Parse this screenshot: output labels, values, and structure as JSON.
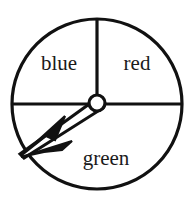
{
  "figure": {
    "name": "spinner-wheel",
    "background_color": "#ffffff",
    "stroke_color": "#111111",
    "text_color": "#1a1a1a"
  },
  "wheel": {
    "center_x": 97,
    "center_y": 104,
    "radius": 85,
    "outline_width": 3
  },
  "sectors": [
    {
      "id": "blue",
      "label": "blue",
      "start_angle_deg": 90,
      "end_angle_deg": 180,
      "span_deg": 90,
      "fraction": 0.25,
      "label_x": 59,
      "label_y": 70
    },
    {
      "id": "red",
      "label": "red",
      "start_angle_deg": 0,
      "end_angle_deg": 90,
      "span_deg": 90,
      "fraction": 0.25,
      "label_x": 137,
      "label_y": 70
    },
    {
      "id": "green",
      "label": "green",
      "start_angle_deg": 180,
      "end_angle_deg": 360,
      "span_deg": 180,
      "fraction": 0.5,
      "label_x": 106,
      "label_y": 165
    }
  ],
  "dividers": [
    {
      "id": "vertical-upper",
      "from_center_angle_deg": 90
    },
    {
      "id": "horizontal-left",
      "from_center_angle_deg": 180
    },
    {
      "id": "horizontal-right",
      "from_center_angle_deg": 0
    }
  ],
  "pointer": {
    "name": "spinner-arrow",
    "points_to_sector": "green",
    "angle_deg": 208,
    "tip_x": 22,
    "tip_y": 156,
    "hub_x": 97,
    "hub_y": 104,
    "hub_radius": 8,
    "hub_fill": "#ffffff",
    "barb_count": 2
  }
}
